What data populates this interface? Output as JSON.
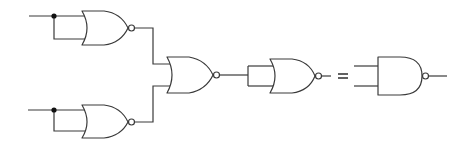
{
  "diagram": {
    "title": "",
    "colors": {
      "line": "#3a3a3a",
      "junction": "#111111",
      "background": "#ffffff"
    },
    "left_circuit": {
      "gates": [
        {
          "id": "nor-1",
          "type": "NOR",
          "inputs": [
            "A",
            "A"
          ],
          "role": "inverter"
        },
        {
          "id": "nor-2",
          "type": "NOR",
          "inputs": [
            "B",
            "B"
          ],
          "role": "inverter"
        },
        {
          "id": "nor-3",
          "type": "NOR",
          "inputs": [
            "nor-1",
            "nor-2"
          ]
        },
        {
          "id": "nor-4",
          "type": "NOR",
          "inputs": [
            "nor-3",
            "nor-3"
          ],
          "role": "inverter"
        }
      ],
      "junctions": 2
    },
    "equals_symbol": "=",
    "right_circuit": {
      "gates": [
        {
          "id": "nand-1",
          "type": "NAND",
          "inputs": 2
        }
      ]
    }
  }
}
